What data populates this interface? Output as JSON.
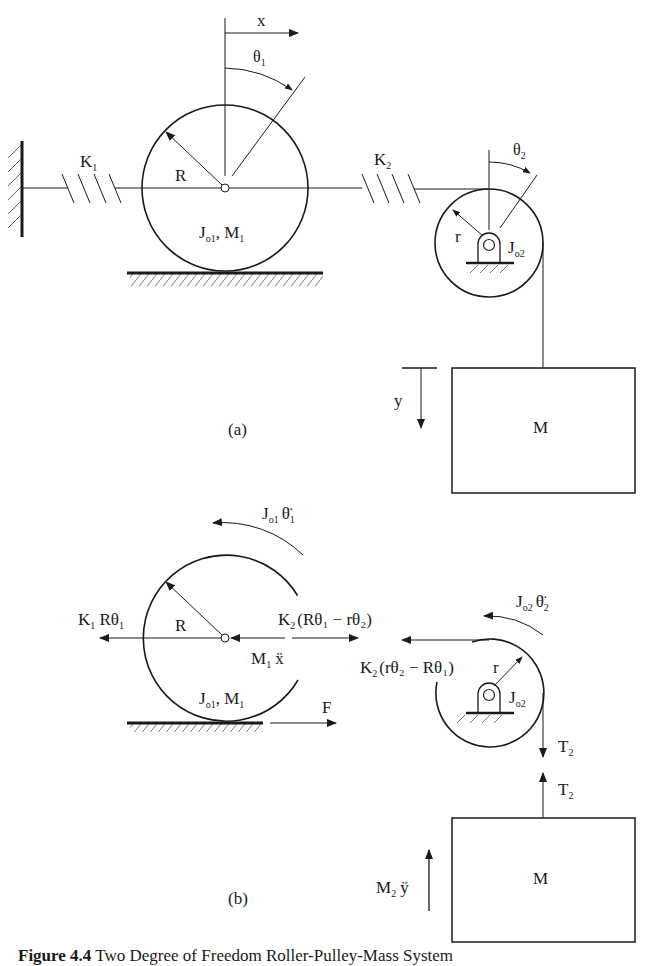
{
  "figure": {
    "caption_number": "Figure 4.4",
    "caption_text": "Two Degree of Freedom Roller-Pulley-Mass System",
    "stroke_color": "#1a1a1a",
    "background": "#ffffff"
  },
  "part_a": {
    "label": "(a)",
    "spring1": "K",
    "spring1_sub": "1",
    "spring2": "K",
    "spring2_sub": "2",
    "roller_radius": "R",
    "roller_inertia": "J",
    "roller_inertia_sub": "o1",
    "roller_mass_sep": ", M",
    "roller_mass_sub": "1",
    "x_coord": "x",
    "theta1": "θ",
    "theta1_sub": "1",
    "theta2": "θ",
    "theta2_sub": "2",
    "pulley_radius": "r",
    "pulley_inertia": "J",
    "pulley_inertia_sub": "o2",
    "y_coord": "y",
    "mass": "M"
  },
  "part_b": {
    "label": "(b)",
    "force_k1": "K",
    "force_k1_sub": "1",
    "force_k1_rest": " Rθ",
    "force_k1_rest_sub": "1",
    "roller_torque": "J",
    "roller_torque_sub": "o1",
    "roller_torque_accel": "θ̈",
    "roller_torque_accel_sub": "1",
    "roller_radius": "R",
    "force_k2_roller": "K",
    "force_k2_roller_sub": "2",
    "force_k2_roller_expr": "(Rθ₁ − rθ₂)",
    "inertia_force": "M",
    "inertia_force_sub": "1",
    "inertia_force_accel": "ẍ",
    "roller_inertia": "J",
    "roller_inertia_sub": "o1",
    "roller_mass_sep": ", M",
    "roller_mass_sub": "1",
    "applied_force": "F",
    "pulley_torque": "J",
    "pulley_torque_sub": "o2",
    "pulley_torque_accel": "θ̈",
    "pulley_torque_accel_sub": "2",
    "force_k2_pulley": "K",
    "force_k2_pulley_sub": "2",
    "force_k2_pulley_expr": "(rθ₂ − Rθ₁)",
    "pulley_radius": "r",
    "pulley_inertia": "J",
    "pulley_inertia_sub": "o2",
    "tension_top": "T",
    "tension_top_sub": "2",
    "tension_bottom": "T",
    "tension_bottom_sub": "2",
    "mass_inertia_force": "M",
    "mass_inertia_force_sub": "2",
    "mass_inertia_force_accel": "ÿ",
    "mass": "M"
  }
}
